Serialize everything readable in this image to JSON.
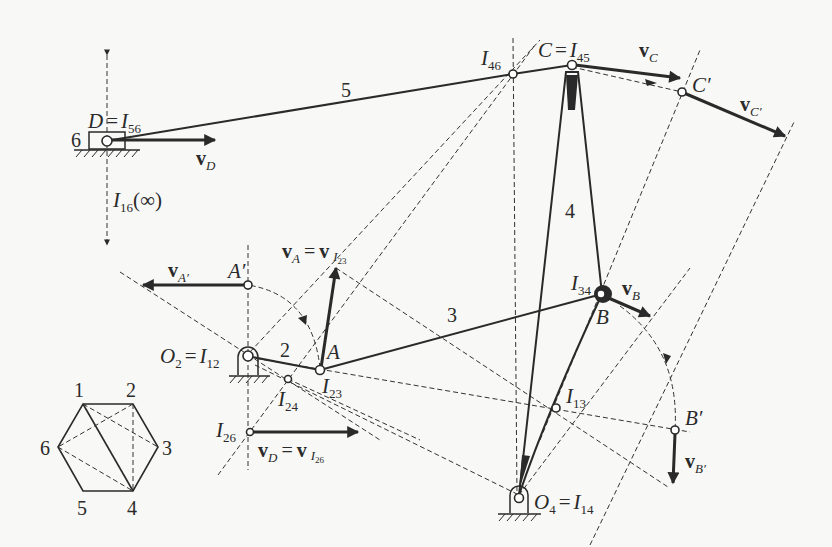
{
  "figure": {
    "links": [
      {
        "id": "2",
        "label": "2"
      },
      {
        "id": "3",
        "label": "3"
      },
      {
        "id": "4",
        "label": "4"
      },
      {
        "id": "5",
        "label": "5"
      },
      {
        "id": "6",
        "label": "6"
      }
    ],
    "points": {
      "D": {
        "label": "D",
        "eq": "=",
        "ic": "I",
        "ic_sub": "56"
      },
      "C": {
        "label": "C",
        "eq": "=",
        "ic": "I",
        "ic_sub": "45"
      },
      "C_prime": {
        "label": "C′"
      },
      "I46": {
        "ic": "I",
        "ic_sub": "46"
      },
      "O2": {
        "label": "O",
        "label_sub": "2",
        "eq": "=",
        "ic": "I",
        "ic_sub": "12"
      },
      "A": {
        "label": "A"
      },
      "A_prime": {
        "label": "A′"
      },
      "I23": {
        "ic": "I",
        "ic_sub": "23"
      },
      "I24": {
        "ic": "I",
        "ic_sub": "24"
      },
      "I26": {
        "ic": "I",
        "ic_sub": "26"
      },
      "B": {
        "label": "B"
      },
      "I34": {
        "ic": "I",
        "ic_sub": "34"
      },
      "B_prime": {
        "label": "B′"
      },
      "I13": {
        "ic": "I",
        "ic_sub": "13"
      },
      "O4": {
        "label": "O",
        "label_sub": "4",
        "eq": "=",
        "ic": "I",
        "ic_sub": "14"
      },
      "I16": {
        "ic": "I",
        "ic_sub": "16",
        "suffix": "(∞)"
      }
    },
    "vectors": {
      "vD": {
        "v": "v",
        "sub": "D"
      },
      "vC": {
        "v": "v",
        "sub": "C"
      },
      "vC_prime": {
        "v": "v",
        "sub": "C′"
      },
      "vB": {
        "v": "v",
        "sub": "B"
      },
      "vB_prime": {
        "v": "v",
        "sub": "B′"
      },
      "vA_prime": {
        "v": "v",
        "sub": "A′"
      },
      "vA": {
        "v": "v",
        "sub": "A",
        "eq": "=",
        "v2": "v",
        "sub2": "I",
        "sub2_sub": "23"
      },
      "vD_eq": {
        "v": "v",
        "sub": "D",
        "eq": "=",
        "v2": "v",
        "sub2": "I",
        "sub2_sub": "26"
      }
    },
    "hexagon": {
      "vertices": [
        "1",
        "2",
        "3",
        "4",
        "5",
        "6"
      ],
      "solid_edges": [
        [
          "1",
          "2"
        ],
        [
          "2",
          "3"
        ],
        [
          "3",
          "4"
        ],
        [
          "4",
          "5"
        ],
        [
          "5",
          "6"
        ],
        [
          "6",
          "1"
        ],
        [
          "1",
          "4"
        ]
      ],
      "dashed_edges": [
        [
          "1",
          "3"
        ],
        [
          "2",
          "4"
        ],
        [
          "2",
          "6"
        ],
        [
          "6",
          "4"
        ]
      ]
    }
  }
}
